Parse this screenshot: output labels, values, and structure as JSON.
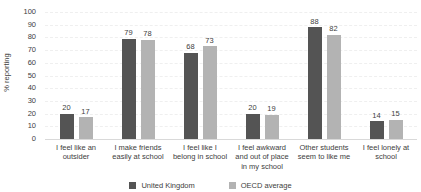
{
  "chart_data": {
    "type": "bar",
    "title": "",
    "xlabel": "",
    "ylabel": "% reporting",
    "ylim": [
      0,
      100
    ],
    "ytick_step": 10,
    "grid": true,
    "legend_position": "bottom",
    "categories": [
      "I feel like an outsider",
      "I make friends easily at school",
      "I feel like I belong in school",
      "I feel awkward and out of place in my school",
      "Other students seem to like me",
      "I feel lonely at school"
    ],
    "series": [
      {
        "name": "United Kingdom",
        "color": "#545454",
        "values": [
          20,
          79,
          68,
          20,
          88,
          14
        ]
      },
      {
        "name": "OECD average",
        "color": "#b3b3b3",
        "values": [
          17,
          78,
          73,
          19,
          82,
          15
        ]
      }
    ]
  }
}
